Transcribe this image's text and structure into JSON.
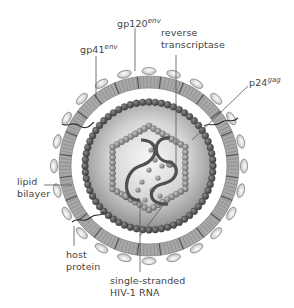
{
  "figure": {
    "center": {
      "x": 149,
      "y": 166
    },
    "colors": {
      "background": "#ffffff",
      "membrane": "#a8a8a8",
      "membrane_stripe": "#8c8c8c",
      "knob_fill": "#e6e6e6",
      "knob_stroke": "#7a7a7a",
      "matrix_bead": "#4f4f4f",
      "capsid_bead": "#8a8a8a",
      "core_light": "#f4f4f4",
      "core_dark": "#9a9a9a",
      "rna": "#505050",
      "leader_line": "#555555",
      "label_text": "#444444"
    }
  },
  "labels": {
    "gp120": {
      "base": "gp120",
      "sup": "env"
    },
    "gp41": {
      "base": "gp41",
      "sup": "env"
    },
    "reverse_transcriptase": {
      "line1": "reverse",
      "line2": "transcriptase"
    },
    "p24": {
      "base": "p24",
      "sup": "gag"
    },
    "lipid_bilayer": {
      "line1": "lipid",
      "line2": "bilayer"
    },
    "host_protein": {
      "line1": "host",
      "line2": "protein"
    },
    "rna": {
      "line1": "single-stranded",
      "line2": "HIV-1 RNA"
    }
  }
}
